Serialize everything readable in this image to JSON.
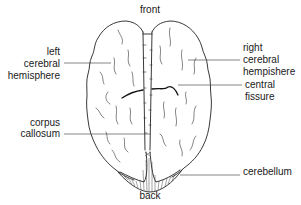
{
  "diagram": {
    "orientation": {
      "top": "front",
      "bottom": "back"
    },
    "labels": {
      "left_hemisphere": [
        "left",
        "cerebral",
        "hemisphere"
      ],
      "right_hemisphere": [
        "right",
        "cerebral",
        "hempishere"
      ],
      "central_fissure": [
        "central",
        "fissure"
      ],
      "corpus_callosum": [
        "corpus",
        "callosum"
      ],
      "cerebellum": [
        "cerebellum"
      ]
    },
    "colors": {
      "line": "#222222",
      "text": "#1a1a1a",
      "background": "#ffffff"
    }
  }
}
